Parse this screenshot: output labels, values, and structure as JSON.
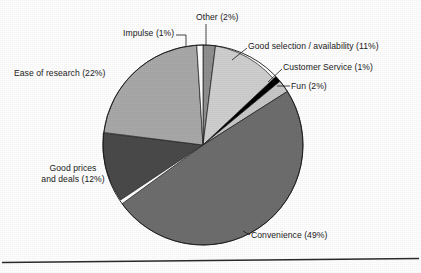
{
  "figure": {
    "background": "#ffffff",
    "text_color": "#1b1b1b",
    "rule_color": "#2a2a2a"
  },
  "chart_data": {
    "type": "pie",
    "title": "",
    "xlabel": "",
    "ylabel": "",
    "legend": "none",
    "labels_position": "outside-with-leader-lines",
    "start_angle_deg": 0,
    "direction": "clockwise",
    "categories": [
      "Other",
      "Good selection / availability",
      "Customer Service",
      "Fun",
      "Convenience",
      "Good prices and deals",
      "Ease of research",
      "Impulse"
    ],
    "values": [
      2,
      11,
      1,
      2,
      49,
      12,
      22,
      1
    ],
    "units": "percent",
    "total": 100,
    "slices": [
      {
        "name": "Other",
        "value": 2,
        "label": "Other (2%)",
        "color": "#8f8f8f"
      },
      {
        "name": "Good selection / availability",
        "value": 11,
        "label": "Good selection / availability (11%)",
        "color": "#cfcfcf"
      },
      {
        "name": "Customer Service",
        "value": 1,
        "label": "Customer Service (1%)",
        "color": "#000000"
      },
      {
        "name": "Fun",
        "value": 2,
        "label": "Fun (2%)",
        "color": "#c8c8c8"
      },
      {
        "name": "Convenience",
        "value": 49,
        "label": "Convenience (49%)",
        "color": "#6e6e6e"
      },
      {
        "name": "Good prices and deals",
        "value": 12,
        "label": "Good prices and deals (12%)",
        "color": "#4a4a4a"
      },
      {
        "name": "Ease of research",
        "value": 22,
        "label": "Ease of research (22%)",
        "color": "#a9a9a9"
      },
      {
        "name": "Impulse",
        "value": 1,
        "label": "Impulse (1%)",
        "color": "#ffffff"
      }
    ]
  },
  "labels": {
    "impulse": "Impulse (1%)",
    "other": "Other (2%)",
    "good_selection": "Good selection / availability (11%)",
    "customer_service": "Customer Service (1%)",
    "fun": "Fun (2%)",
    "ease_of_research": "Ease of research (22%)",
    "good_prices_line1": "Good prices",
    "good_prices_line2": "and deals (12%)",
    "convenience": "Convenience (49%)"
  }
}
